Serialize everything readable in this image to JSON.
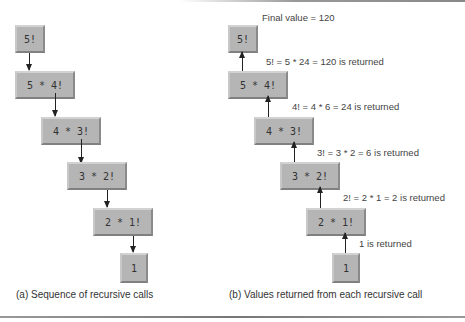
{
  "panel_a": {
    "caption": "(a) Sequence of recursive calls",
    "boxes": [
      "5!",
      "5 * 4!",
      "4 * 3!",
      "3 * 2!",
      "2 * 1!",
      "1"
    ]
  },
  "panel_b": {
    "caption": "(b) Values returned from each recursive call",
    "final_value": "Final value = 120",
    "boxes": [
      "5!",
      "5 * 4!",
      "4 * 3!",
      "3 * 2!",
      "2 * 1!",
      "1"
    ],
    "returns": [
      "5! = 5 * 24 = 120 is returned",
      "4! = 4 * 6 = 24 is returned",
      "3! = 3 * 2 = 6 is returned",
      "2! = 2 * 1 = 2 is returned",
      "1 is returned"
    ]
  },
  "colors": {
    "box_fill": "#b5b5b5",
    "arrow": "#222222",
    "text": "#333333"
  }
}
